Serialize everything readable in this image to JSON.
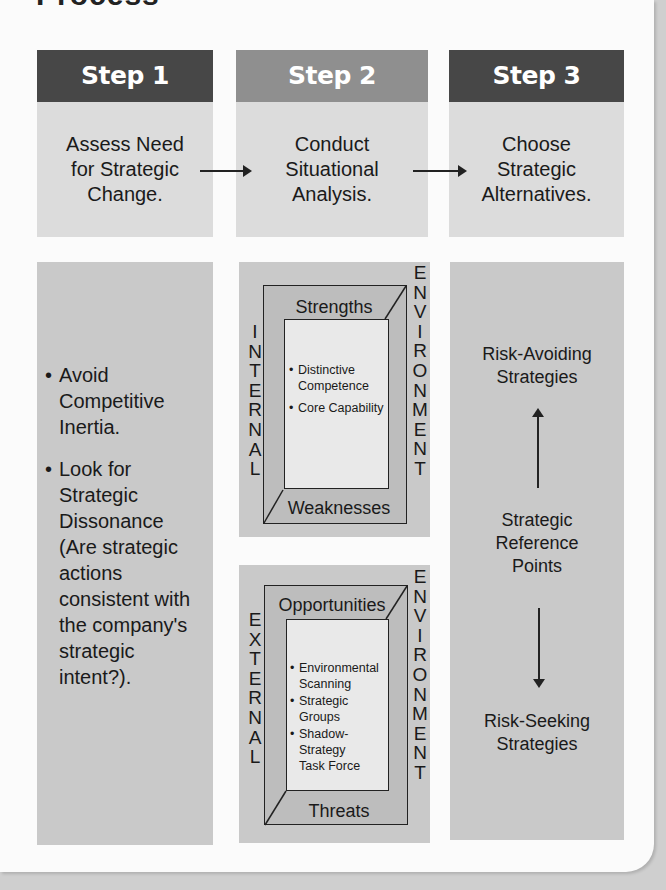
{
  "title": "Process",
  "colors": {
    "step_dark": "#474747",
    "step_mid": "#8f8f8f",
    "desc_bg": "#dcdcdc",
    "panel_bg": "#c9c9c9"
  },
  "steps": [
    {
      "label": "Step 1",
      "description": "Assess Need for Strategic Change."
    },
    {
      "label": "Step 2",
      "description": "Conduct Situational Analysis."
    },
    {
      "label": "Step 3",
      "description": "Choose Strategic Alternatives."
    }
  ],
  "step1_panel": {
    "bullets": [
      "Avoid Competitive Inertia.",
      "Look for Strategic Dissonance (Are strategic actions consistent with the company's strategic intent?)."
    ]
  },
  "step2_panel": {
    "internal": {
      "side_label": "INTERNAL",
      "env_label": "ENVIRONMENT",
      "top": "Strengths",
      "bottom": "Weaknesses",
      "items": [
        "Distinctive Competence",
        "Core Capability"
      ]
    },
    "external": {
      "side_label": "EXTERNAL",
      "env_label": "ENVIRONMENT",
      "top": "Opportunities",
      "bottom": "Threats",
      "items": [
        "Environmental Scanning",
        "Strategic Groups",
        "Shadow-Strategy Task Force"
      ]
    }
  },
  "step3_panel": {
    "top": "Risk-Avoiding Strategies",
    "middle": "Strategic Reference Points",
    "bottom": "Risk-Seeking Strategies"
  }
}
